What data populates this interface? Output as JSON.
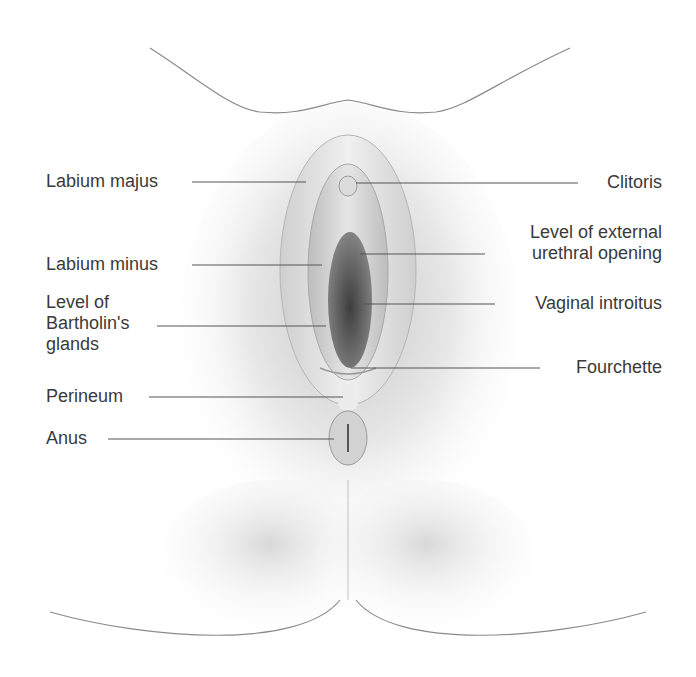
{
  "diagram": {
    "colors": {
      "background": "#ffffff",
      "label_text": "#3a3a3a",
      "leader_line": "#555555",
      "shading_light": "#f2f2f2",
      "shading_mid": "#cfcfcf",
      "shading_dark": "#6a6a6a"
    },
    "labels_left": [
      {
        "id": "labium-majus",
        "text": "Labium majus"
      },
      {
        "id": "labium-minus",
        "text": "Labium minus"
      },
      {
        "id": "bartholins-glands",
        "text": "Level of\nBartholin's\nglands"
      },
      {
        "id": "perineum",
        "text": "Perineum"
      },
      {
        "id": "anus",
        "text": "Anus"
      }
    ],
    "labels_right": [
      {
        "id": "clitoris",
        "text": "Clitoris"
      },
      {
        "id": "urethral-opening",
        "text": "Level of external\nurethral opening"
      },
      {
        "id": "vaginal-introitus",
        "text": "Vaginal introitus"
      },
      {
        "id": "fourchette",
        "text": "Fourchette"
      }
    ]
  }
}
